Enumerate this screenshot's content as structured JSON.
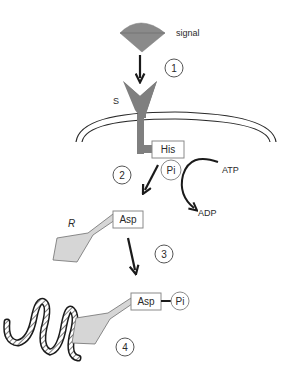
{
  "diagram": {
    "labels": {
      "signal": "signal",
      "sensor": "S",
      "regulator": "R",
      "his_box": "His",
      "asp_box": "Asp",
      "asp_box_2": "Asp",
      "pi_1": "Pi",
      "pi_2": "Pi",
      "atp": "ATP",
      "adp": "ADP"
    },
    "steps": [
      "1",
      "2",
      "3",
      "4"
    ],
    "colors": {
      "signal_fill": "#8a8a8a",
      "sensor_fill": "#7f7f7f",
      "regulator_fill": "#d6d6d6",
      "line": "#1a1a1a",
      "membrane": "#2a2a2a",
      "box_border": "#8a8a8a"
    }
  }
}
